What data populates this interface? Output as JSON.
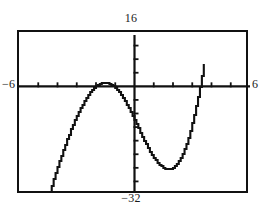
{
  "window": {
    "title": "graphing-calculator-plot",
    "labels": {
      "ymax": "16",
      "ymin": "−32",
      "xmin": "−6",
      "xmax": "6"
    }
  },
  "chart_data": {
    "type": "line",
    "title": "",
    "xlabel": "",
    "ylabel": "",
    "xlim": [
      -6,
      6
    ],
    "ylim": [
      -32,
      16
    ],
    "grid": false,
    "legend": null,
    "axes": {
      "x_axis_y_value": 0,
      "y_axis_x_value": 0,
      "x_tick_step": 1,
      "y_tick_step": 4,
      "x_ticks": [
        -5,
        -4,
        -3,
        -2,
        -1,
        1,
        2,
        3,
        4,
        5
      ],
      "y_ticks": [
        -28,
        -24,
        -20,
        -16,
        -12,
        -8,
        -4,
        4,
        8,
        12
      ]
    },
    "series": [
      {
        "name": "cubic",
        "style": "pixelated-stair-step",
        "color": "#111111",
        "x": [
          -4.4,
          -4.3,
          -4.2,
          -4.1,
          -4.0,
          -3.9,
          -3.8,
          -3.7,
          -3.6,
          -3.5,
          -3.4,
          -3.3,
          -3.2,
          -3.1,
          -3.0,
          -2.9,
          -2.8,
          -2.7,
          -2.6,
          -2.5,
          -2.4,
          -2.3,
          -2.2,
          -2.1,
          -2.0,
          -1.9,
          -1.8,
          -1.7,
          -1.6,
          -1.5,
          -1.4,
          -1.3,
          -1.2,
          -1.1,
          -1.0,
          -0.9,
          -0.8,
          -0.7,
          -0.6,
          -0.5,
          -0.4,
          -0.3,
          -0.2,
          -0.1,
          0.0,
          0.1,
          0.2,
          0.3,
          0.4,
          0.5,
          0.6,
          0.7,
          0.8,
          0.9,
          1.0,
          1.1,
          1.2,
          1.3,
          1.4,
          1.5,
          1.6,
          1.7,
          1.8,
          1.9,
          2.0,
          2.1,
          2.2,
          2.3,
          2.4,
          2.5,
          2.6,
          2.7,
          2.8,
          2.9,
          3.0,
          3.1,
          3.2,
          3.3,
          3.4,
          3.5,
          3.6
        ],
        "y": [
          -31.2,
          -29.3,
          -27.4,
          -25.6,
          -23.8,
          -22.1,
          -20.4,
          -18.8,
          -17.2,
          -15.6,
          -14.2,
          -12.7,
          -11.4,
          -10.0,
          -8.8,
          -7.6,
          -6.5,
          -5.4,
          -4.4,
          -3.5,
          -2.6,
          -1.8,
          -1.1,
          -0.5,
          0.0,
          0.4,
          0.7,
          0.9,
          1.0,
          1.0,
          0.9,
          0.7,
          0.4,
          0.0,
          -0.5,
          -1.1,
          -1.8,
          -2.6,
          -3.5,
          -4.4,
          -5.4,
          -6.5,
          -7.6,
          -8.8,
          -10.0,
          -11.2,
          -12.4,
          -13.6,
          -14.8,
          -16.0,
          -17.1,
          -18.2,
          -19.2,
          -20.2,
          -21.0,
          -21.8,
          -22.5,
          -23.1,
          -23.6,
          -24.0,
          -24.3,
          -24.4,
          -24.4,
          -24.3,
          -24.0,
          -23.5,
          -22.9,
          -22.1,
          -21.1,
          -19.9,
          -18.5,
          -16.9,
          -15.1,
          -13.1,
          -10.9,
          -8.5,
          -5.9,
          -3.1,
          -0.1,
          3.1,
          6.5
        ],
        "features": {
          "local_maximum": {
            "x": -1.55,
            "y": 1.0
          },
          "local_minimum": {
            "x": 1.75,
            "y": -24.4
          },
          "x_intercepts": [
            -2.0,
            -1.1,
            3.4
          ]
        }
      }
    ]
  }
}
